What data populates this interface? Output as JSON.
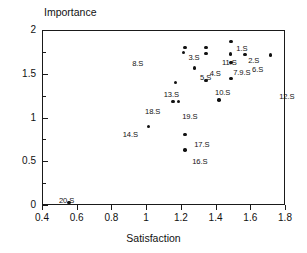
{
  "chart_data": {
    "type": "scatter",
    "title": "",
    "xlabel": "Satisfaction",
    "ylabel": "Importance",
    "xlim": [
      0.4,
      1.8
    ],
    "ylim": [
      0,
      2
    ],
    "grid": false,
    "legend": "none",
    "x_ticks": [
      "0.4",
      "0.6",
      "0.8",
      "1",
      "1.2",
      "1.4",
      "1.6",
      "1.8"
    ],
    "x_tick_values": [
      0.4,
      0.6,
      0.8,
      1.0,
      1.2,
      1.4,
      1.6,
      1.8
    ],
    "y_ticks": [
      "0",
      "0.5",
      "1",
      "1.5",
      "2"
    ],
    "y_tick_values": [
      0,
      0.5,
      1.0,
      1.5,
      2.0
    ],
    "y_minor_tick_values": [
      0.25,
      0.75,
      1.25,
      1.75
    ],
    "marker": "filled-circle",
    "marker_color": "#111111",
    "points": [
      {
        "label": "1.S",
        "x": 1.485,
        "y": 1.725,
        "lx": 6,
        "ly": -10
      },
      {
        "label": "2.S",
        "x": 1.715,
        "y": 1.715,
        "lx": -22,
        "ly": 1
      },
      {
        "label": "3.S",
        "x": 1.215,
        "y": 1.745,
        "lx": 5,
        "ly": 1
      },
      {
        "label": "4.S",
        "x": 1.28,
        "y": 1.565,
        "lx": 15,
        "ly": 1
      },
      {
        "label": "5.S",
        "x": 1.345,
        "y": 1.42,
        "lx": -6,
        "ly": -8
      },
      {
        "label": "6.S",
        "x": 1.57,
        "y": 1.72,
        "lx": 7,
        "ly": 10
      },
      {
        "label": "7.9.S",
        "x": 1.49,
        "y": 1.445,
        "lx": 2,
        "ly": -11
      },
      {
        "label": "8.S",
        "x": 1.225,
        "y": 1.8,
        "lx": -53,
        "ly": 11
      },
      {
        "label": "10.S",
        "x": 1.42,
        "y": 1.2,
        "lx": -4,
        "ly": -12
      },
      {
        "label": "11.S",
        "x": 1.345,
        "y": 1.8,
        "lx": 16,
        "ly": 10
      },
      {
        "label": "12.S",
        "x": 1.49,
        "y": 1.63,
        "lx": 48,
        "ly": 30
      },
      {
        "label": "13.S",
        "x": 1.17,
        "y": 1.4,
        "lx": -12,
        "ly": 7
      },
      {
        "label": "14.S",
        "x": 1.015,
        "y": 0.9,
        "lx": -26,
        "ly": 4
      },
      {
        "label": "16.S",
        "x": 1.225,
        "y": 0.63,
        "lx": 7,
        "ly": 7
      },
      {
        "label": "17.S",
        "x": 1.225,
        "y": 0.805,
        "lx": 9,
        "ly": 5
      },
      {
        "label": "18.S",
        "x": 1.155,
        "y": 1.18,
        "lx": -28,
        "ly": 5
      },
      {
        "label": "19.S",
        "x": 1.185,
        "y": 1.18,
        "lx": 4,
        "ly": 10
      },
      {
        "label": "20.S",
        "x": 0.555,
        "y": 0.03,
        "lx": -10,
        "ly": -6
      },
      {
        "label": "",
        "x": 1.49,
        "y": 1.87,
        "lx": 0,
        "ly": 0
      },
      {
        "label": "",
        "x": 1.345,
        "y": 1.73,
        "lx": 0,
        "ly": 0
      }
    ]
  }
}
